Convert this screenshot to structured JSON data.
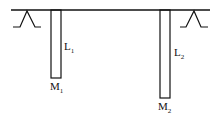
{
  "diagram": {
    "colors": {
      "stroke": "#111111",
      "background": "#ffffff"
    },
    "rods": [
      {
        "length_label": "L",
        "length_sub": "1",
        "mass_label": "M",
        "mass_sub": "1"
      },
      {
        "length_label": "L",
        "length_sub": "2",
        "mass_label": "M",
        "mass_sub": "2"
      }
    ]
  }
}
